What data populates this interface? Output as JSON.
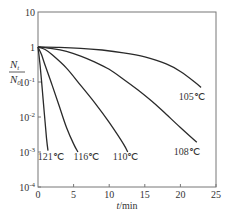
{
  "chart_data": {
    "type": "line",
    "title": "",
    "xlabel": "t/min",
    "ylabel": "N_t / N_0",
    "ylabel_num": "N",
    "ylabel_num_sub": "t",
    "ylabel_den": "N",
    "ylabel_den_sub": "0",
    "xlim": [
      0,
      25
    ],
    "ylim": [
      0.0001,
      10
    ],
    "yscale": "log",
    "grid": false,
    "legend": "inline labels at curve ends",
    "x_ticks": [
      0,
      5,
      10,
      15,
      20,
      25
    ],
    "x_tick_labels": [
      "0",
      "5",
      "10",
      "15",
      "20",
      "25"
    ],
    "y_ticks": [
      10,
      1,
      0.1,
      0.01,
      0.001,
      0.0001
    ],
    "y_tick_labels": [
      {
        "base": "10",
        "exp": ""
      },
      {
        "base": "1",
        "exp": ""
      },
      {
        "base": "10",
        "exp": "-1"
      },
      {
        "base": "10",
        "exp": "-2"
      },
      {
        "base": "10",
        "exp": "-3"
      },
      {
        "base": "10",
        "exp": "-4"
      }
    ],
    "series": [
      {
        "name": "121℃",
        "x": [
          0,
          0.3,
          0.6,
          0.9,
          1.2,
          1.4
        ],
        "y": [
          1,
          0.3,
          0.06,
          0.012,
          0.0025,
          0.0011
        ]
      },
      {
        "name": "116℃",
        "x": [
          0,
          0.5,
          1.0,
          2.0,
          3.0,
          4.0,
          5.0,
          5.6
        ],
        "y": [
          1,
          0.6,
          0.3,
          0.08,
          0.02,
          0.005,
          0.0017,
          0.001
        ]
      },
      {
        "name": "110℃",
        "x": [
          0,
          1,
          2,
          4,
          6,
          8,
          10,
          12,
          12.6
        ],
        "y": [
          1,
          0.85,
          0.6,
          0.25,
          0.08,
          0.025,
          0.007,
          0.0017,
          0.001
        ]
      },
      {
        "name": "108℃",
        "x": [
          0,
          2,
          4,
          6,
          8,
          10,
          12,
          14,
          16,
          18,
          20,
          22.3
        ],
        "y": [
          1,
          0.9,
          0.75,
          0.55,
          0.37,
          0.23,
          0.12,
          0.06,
          0.028,
          0.012,
          0.005,
          0.0019
        ]
      },
      {
        "name": "105℃",
        "x": [
          0,
          3,
          6,
          9,
          12,
          15,
          18,
          20,
          22,
          22.9
        ],
        "y": [
          1,
          0.98,
          0.92,
          0.82,
          0.68,
          0.52,
          0.33,
          0.2,
          0.1,
          0.07
        ]
      }
    ],
    "labels": [
      {
        "text": "121℃",
        "x": 1.8,
        "y": 0.0006
      },
      {
        "text": "116℃",
        "x": 6.8,
        "y": 0.0006
      },
      {
        "text": "110℃",
        "x": 12.3,
        "y": 0.0006
      },
      {
        "text": "108℃",
        "x": 20.9,
        "y": 0.0008
      },
      {
        "text": "105℃",
        "x": 21.6,
        "y": 0.03
      }
    ]
  }
}
